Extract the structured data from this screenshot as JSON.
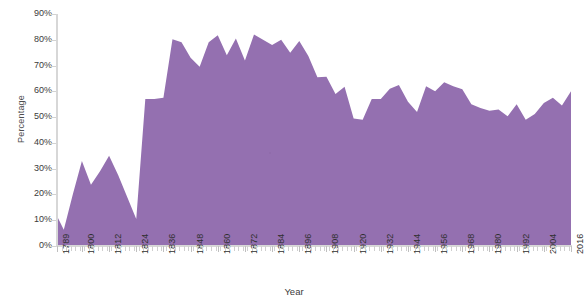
{
  "chart_data": {
    "type": "area",
    "title": "",
    "xlabel": "Year",
    "ylabel": "Percentage",
    "ylim": [
      0,
      90
    ],
    "xlim": [
      1789,
      2016
    ],
    "grid": false,
    "legend": null,
    "series_color": "#9470b0",
    "ytick_labels": [
      "0%",
      "10%",
      "20%",
      "30%",
      "40%",
      "50%",
      "60%",
      "70%",
      "80%",
      "90%"
    ],
    "ytick_values": [
      0,
      10,
      20,
      30,
      40,
      50,
      60,
      70,
      80,
      90
    ],
    "xtick_labels": [
      "1789",
      "1800",
      "1812",
      "1824",
      "1836",
      "1848",
      "1860",
      "1872",
      "1884",
      "1896",
      "1908",
      "1920",
      "1932",
      "1944",
      "1956",
      "1968",
      "1980",
      "1992",
      "2004",
      "2016"
    ],
    "xtick_values": [
      1789,
      1800,
      1812,
      1824,
      1836,
      1848,
      1860,
      1872,
      1884,
      1896,
      1908,
      1920,
      1932,
      1944,
      1956,
      1968,
      1980,
      1992,
      2004,
      2016
    ],
    "x": [
      1789,
      1792,
      1796,
      1800,
      1804,
      1808,
      1812,
      1816,
      1820,
      1824,
      1828,
      1832,
      1836,
      1840,
      1844,
      1848,
      1852,
      1856,
      1860,
      1864,
      1868,
      1872,
      1876,
      1880,
      1884,
      1888,
      1892,
      1896,
      1900,
      1904,
      1908,
      1912,
      1916,
      1920,
      1924,
      1928,
      1932,
      1936,
      1940,
      1944,
      1948,
      1952,
      1956,
      1960,
      1964,
      1968,
      1972,
      1976,
      1980,
      1984,
      1988,
      1992,
      1996,
      2000,
      2004,
      2008,
      2012,
      2016
    ],
    "values": [
      11.6,
      6.3,
      20.1,
      33.0,
      23.8,
      29.0,
      35.0,
      27.5,
      19.0,
      10.5,
      57.0,
      57.0,
      57.5,
      80.2,
      79.0,
      73.0,
      69.5,
      79.0,
      81.8,
      74.0,
      80.5,
      72.0,
      82.0,
      80.0,
      78.0,
      80.0,
      75.0,
      79.5,
      73.7,
      65.5,
      65.7,
      59.0,
      61.8,
      49.5,
      49.0,
      57.0,
      57.0,
      61.0,
      62.5,
      56.0,
      52.0,
      62.0,
      60.0,
      63.5,
      62.0,
      60.8,
      55.0,
      53.5,
      52.5,
      53.0,
      50.3,
      55.0,
      49.0,
      51.2,
      55.5,
      57.5,
      54.5,
      60.0
    ]
  }
}
